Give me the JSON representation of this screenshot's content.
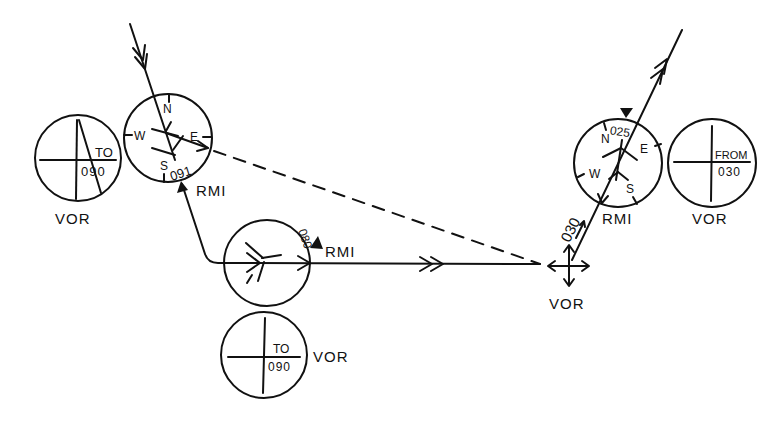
{
  "diagram": {
    "labels": {
      "left_vor_label": "VOR",
      "left_vor_flag": "TO",
      "left_vor_course": "090",
      "upper_rmi_label": "RMI",
      "upper_rmi_bearing": "091",
      "mid_rmi_label": "RMI",
      "mid_rmi_bearing": "080",
      "lower_vor_label": "VOR",
      "lower_vor_flag": "TO",
      "lower_vor_course": "090",
      "station_label": "VOR",
      "radial_label": "030",
      "right_rmi_label": "RMI",
      "right_rmi_bearing": "025",
      "right_vor_label": "VOR",
      "right_vor_flag": "FROM",
      "right_vor_course": "030"
    },
    "compass": {
      "north": "N",
      "east": "E",
      "south": "S",
      "west": "W"
    },
    "colors": {
      "ink": "#111111",
      "background": "#ffffff"
    }
  }
}
